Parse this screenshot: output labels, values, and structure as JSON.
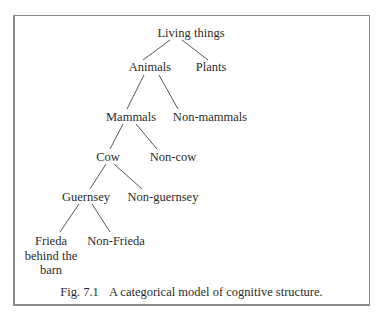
{
  "figure": {
    "number": "Fig. 7.1",
    "caption": "A categorical model of cognitive structure.",
    "tree": {
      "root": "Living things",
      "level1": {
        "left": "Animals",
        "right": "Plants"
      },
      "level2": {
        "left": "Mammals",
        "right": "Non-mammals"
      },
      "level3": {
        "left": "Cow",
        "right": "Non-cow"
      },
      "level4": {
        "left": "Guernsey",
        "right": "Non-guernsey"
      },
      "level5": {
        "left_lines": [
          "Frieda",
          "behind the",
          "barn"
        ],
        "right": "Non-Frieda"
      }
    }
  }
}
